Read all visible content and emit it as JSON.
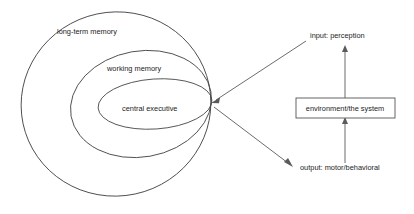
{
  "diagram": {
    "background_color": "#ffffff",
    "stroke_color": "#4a4a4a",
    "text_color": "#1c1c1c",
    "memory_rings": [
      {
        "id": "long-term-memory",
        "label": "long-term memory",
        "label_x": 57,
        "label_y": 34,
        "level": 1
      },
      {
        "id": "working-memory",
        "label": "working memory",
        "label_x": 107,
        "label_y": 71,
        "level": 2
      },
      {
        "id": "central-executive",
        "label": "central executive",
        "label_x": 122,
        "label_y": 111,
        "level": 3
      }
    ],
    "system_box": {
      "label": "environment/the system",
      "x": 296,
      "y": 98,
      "width": 99,
      "height": 20
    },
    "input_label": "input: perception",
    "output_label": "output: motor/behavioral",
    "convergence_point": {
      "x": 211,
      "y": 103
    }
  }
}
